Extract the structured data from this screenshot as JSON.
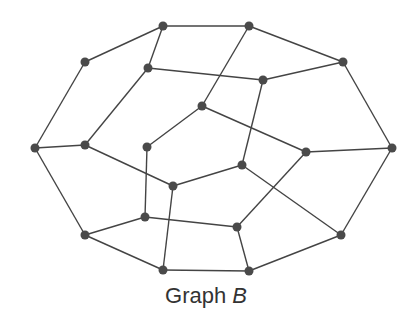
{
  "caption": {
    "prefix": "Graph ",
    "label": "B"
  },
  "colors": {
    "edge": "#444444",
    "node": "#4a4a4a"
  },
  "nodes": [
    {
      "id": "A",
      "x": 163,
      "y": 26
    },
    {
      "id": "B",
      "x": 249,
      "y": 26
    },
    {
      "id": "C",
      "x": 85,
      "y": 62
    },
    {
      "id": "D",
      "x": 148,
      "y": 68
    },
    {
      "id": "E",
      "x": 343,
      "y": 62
    },
    {
      "id": "F",
      "x": 263,
      "y": 80
    },
    {
      "id": "G",
      "x": 202,
      "y": 106
    },
    {
      "id": "H",
      "x": 35,
      "y": 148
    },
    {
      "id": "I",
      "x": 85,
      "y": 145
    },
    {
      "id": "J",
      "x": 147,
      "y": 147
    },
    {
      "id": "K",
      "x": 242,
      "y": 165
    },
    {
      "id": "L",
      "x": 306,
      "y": 152
    },
    {
      "id": "M",
      "x": 392,
      "y": 148
    },
    {
      "id": "N",
      "x": 173,
      "y": 186
    },
    {
      "id": "O",
      "x": 145,
      "y": 217
    },
    {
      "id": "P",
      "x": 237,
      "y": 227
    },
    {
      "id": "Q",
      "x": 85,
      "y": 235
    },
    {
      "id": "R",
      "x": 341,
      "y": 235
    },
    {
      "id": "S",
      "x": 163,
      "y": 270
    },
    {
      "id": "T",
      "x": 249,
      "y": 271
    }
  ],
  "edges": [
    [
      "A",
      "B"
    ],
    [
      "A",
      "C"
    ],
    [
      "A",
      "D"
    ],
    [
      "B",
      "E"
    ],
    [
      "B",
      "G"
    ],
    [
      "C",
      "H"
    ],
    [
      "D",
      "I"
    ],
    [
      "D",
      "F"
    ],
    [
      "F",
      "E"
    ],
    [
      "F",
      "K"
    ],
    [
      "E",
      "M"
    ],
    [
      "H",
      "I"
    ],
    [
      "H",
      "Q"
    ],
    [
      "I",
      "N"
    ],
    [
      "G",
      "J"
    ],
    [
      "G",
      "L"
    ],
    [
      "J",
      "O"
    ],
    [
      "N",
      "K"
    ],
    [
      "N",
      "S"
    ],
    [
      "K",
      "R"
    ],
    [
      "L",
      "P"
    ],
    [
      "L",
      "M"
    ],
    [
      "O",
      "P"
    ],
    [
      "O",
      "Q"
    ],
    [
      "Q",
      "S"
    ],
    [
      "S",
      "T"
    ],
    [
      "P",
      "T"
    ],
    [
      "T",
      "R"
    ],
    [
      "R",
      "M"
    ]
  ]
}
